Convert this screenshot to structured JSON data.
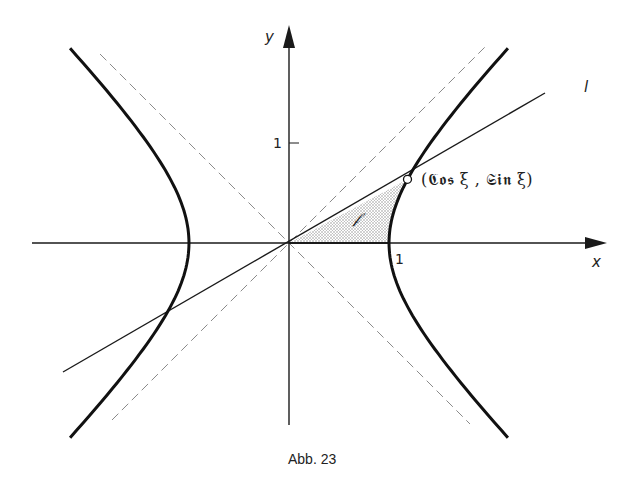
{
  "figure": {
    "caption": "Abb. 23",
    "type": "hyperbola-diagram"
  },
  "axes": {
    "x_label": "x",
    "y_label": "y",
    "x_tick_label": "1",
    "y_tick_label": "1"
  },
  "labels": {
    "line_label": "l",
    "point_label": "(𝕮𝖔𝖘 ξ , 𝕾𝖎𝖓 ξ)",
    "area_label": "𝒻"
  },
  "geometry": {
    "origin_px": [
      289,
      243
    ],
    "unit_px": 100,
    "xi": 0.6,
    "point": {
      "x": 1.1855,
      "y": 0.6367
    },
    "hyperbola": "x^2 - y^2 = 1",
    "asymptotes": [
      "y = x",
      "y = -x"
    ],
    "line_l_slope": 0.537
  },
  "colors": {
    "ink": "#1a1a1a",
    "asymptote": "#8a8a8a",
    "shade": "#c8c8c8",
    "background": "#ffffff"
  }
}
